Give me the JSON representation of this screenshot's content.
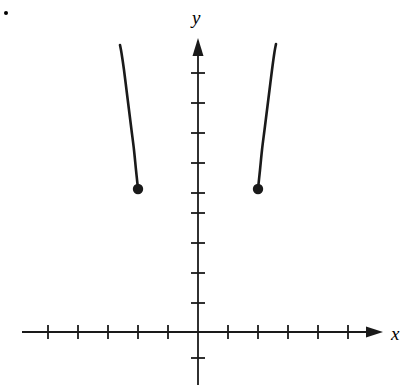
{
  "figure": {
    "width": 419,
    "height": 392,
    "background_color": "#ffffff",
    "ink_color": "#1a1a1a",
    "bullet_marker": "item-bullet"
  },
  "axes": {
    "x_label": "x",
    "y_label": "y",
    "origin_px": [
      198,
      332
    ],
    "unit_px": 30,
    "x_axis": {
      "y_px": 332,
      "start_px": 22,
      "arrow_tip_px": 383,
      "tick_half_len_px": 7,
      "tick_positions_px": [
        48,
        78,
        108,
        138,
        168,
        228,
        258,
        288,
        318,
        348
      ],
      "tick_values": [
        -5,
        -4,
        -3,
        -2,
        -1,
        1,
        2,
        3,
        4,
        5
      ],
      "tick_labels_shown": false
    },
    "y_axis": {
      "x_px": 198,
      "bottom_px": 385,
      "arrow_tip_px": 38,
      "tick_half_len_px": 7,
      "tick_positions_px": [
        73,
        103,
        133,
        163,
        193,
        213,
        243,
        273,
        303,
        358
      ],
      "tick_values": [
        8,
        7,
        6,
        5,
        4,
        3.5,
        3,
        2,
        1,
        -1
      ],
      "tick_labels_shown": false
    },
    "grid": false,
    "legend": null
  },
  "chart_data": {
    "type": "line",
    "title": "",
    "subtitle": "",
    "xlabel": "x",
    "ylabel": "y",
    "grid": false,
    "legend_position": "none",
    "xlim": [
      -5.9,
      6.2
    ],
    "ylim": [
      -1.8,
      9.8
    ],
    "axis_tick_step": 1,
    "series": [
      {
        "name": "left-branch",
        "style": "solid",
        "color": "#1a1a1a",
        "line_width_px": 2.6,
        "endpoint_marker": "closed-dot",
        "endpoint": {
          "x": -2.0,
          "y": 4.77,
          "px": [
            138,
            189
          ]
        },
        "points_px": [
          [
            138,
            189
          ],
          [
            136,
            170
          ],
          [
            134,
            150
          ],
          [
            131.5,
            130
          ],
          [
            129,
            110
          ],
          [
            126.5,
            90
          ],
          [
            124,
            70
          ],
          [
            121.5,
            53
          ],
          [
            120,
            45
          ]
        ],
        "points_data": [
          [
            -2.0,
            4.77
          ],
          [
            -2.07,
            5.4
          ],
          [
            -2.13,
            6.07
          ],
          [
            -2.22,
            6.73
          ],
          [
            -2.3,
            7.4
          ],
          [
            -2.38,
            8.07
          ],
          [
            -2.47,
            8.73
          ],
          [
            -2.55,
            9.3
          ],
          [
            -2.6,
            9.57
          ]
        ]
      },
      {
        "name": "right-branch",
        "style": "solid",
        "color": "#1a1a1a",
        "line_width_px": 2.6,
        "endpoint_marker": "closed-dot",
        "endpoint": {
          "x": 2.0,
          "y": 4.77,
          "px": [
            258,
            189
          ]
        },
        "points_px": [
          [
            258,
            189
          ],
          [
            260,
            170
          ],
          [
            262,
            150
          ],
          [
            264.5,
            130
          ],
          [
            267,
            110
          ],
          [
            269.5,
            90
          ],
          [
            272,
            70
          ],
          [
            274.5,
            52
          ],
          [
            276,
            44
          ]
        ],
        "points_data": [
          [
            2.0,
            4.77
          ],
          [
            2.07,
            5.4
          ],
          [
            2.13,
            6.07
          ],
          [
            2.22,
            6.73
          ],
          [
            2.3,
            7.4
          ],
          [
            2.38,
            8.07
          ],
          [
            2.47,
            8.73
          ],
          [
            2.55,
            9.33
          ],
          [
            2.6,
            9.6
          ]
        ]
      }
    ],
    "markers": [
      {
        "name": "left-endpoint-dot",
        "filled": true,
        "x": -2.0,
        "y": 4.77,
        "px": [
          138,
          189
        ],
        "radius_px": 5.2
      },
      {
        "name": "right-endpoint-dot",
        "filled": true,
        "x": 2.0,
        "y": 4.77,
        "px": [
          258,
          189
        ],
        "radius_px": 5.2
      }
    ],
    "annotations": []
  }
}
